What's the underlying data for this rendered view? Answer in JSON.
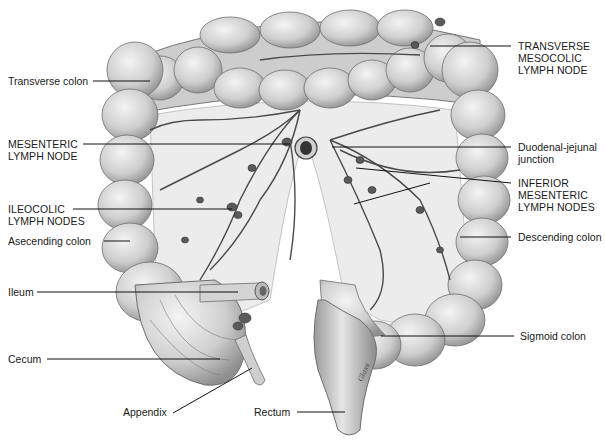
{
  "figure": {
    "artist_signature": "Glass"
  },
  "labels": {
    "transverse_colon": "Transverse colon",
    "mesenteric_lymph_node": "MESENTERIC\nLYMPH NODE",
    "ileocolic_lymph_nodes": "ILEOCOLIC\nLYMPH NODES",
    "ascending_colon": "Asecending colon",
    "ileum": "Ileum",
    "cecum": "Cecum",
    "appendix": "Appendix",
    "rectum": "Rectum",
    "transverse_mesocolic_lymph_node": "TRANSVERSE\nMESOCOLIC\nLYMPH NODE",
    "duodenal_jejunal_junction": "Duodenal-jejunal\njunction",
    "inferior_mesenteric_lymph_nodes": "INFERIOR\nMESENTERIC\nLYMPH NODES",
    "descending_colon": "Descending colon",
    "sigmoid_colon": "Sigmoid colon"
  },
  "colors": {
    "background": "#ffffff",
    "colon_fill": "#d9d9d9",
    "colon_shade": "#a8a8a8",
    "mesentery": "#e8e8e8",
    "vessel": "#4a4a4a",
    "node": "#555555",
    "leader_line": "#111111"
  }
}
